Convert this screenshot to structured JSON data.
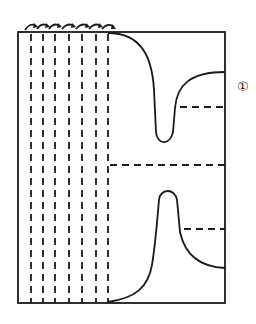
{
  "diagram": {
    "step_label": "①",
    "stroke_color": "#1a1a1a",
    "background": "#ffffff",
    "fold_lines_vertical_count": 7,
    "fold_arrows_count": 7
  }
}
